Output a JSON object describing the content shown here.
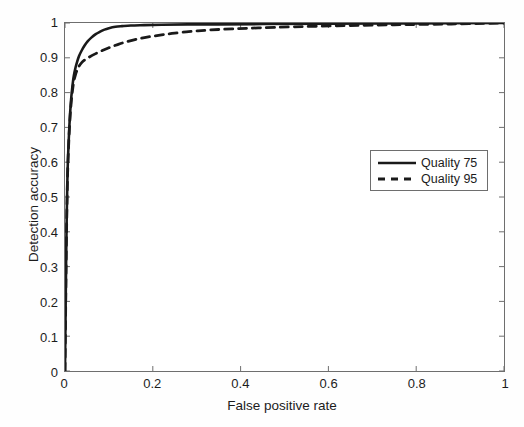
{
  "chart_data": {
    "type": "line",
    "title": "",
    "xlabel": "False positive rate",
    "ylabel": "Detection accuracy",
    "xlim": [
      0,
      1
    ],
    "ylim": [
      0,
      1
    ],
    "grid": false,
    "legend_position": "upper-right",
    "xticks": [
      "0",
      "0.2",
      "0.4",
      "0.6",
      "0.8",
      "1"
    ],
    "xtick_values": [
      0,
      0.2,
      0.4,
      0.6,
      0.8,
      1
    ],
    "yticks": [
      "0",
      "0.1",
      "0.2",
      "0.3",
      "0.4",
      "0.5",
      "0.6",
      "0.7",
      "0.8",
      "0.9",
      "1"
    ],
    "ytick_values": [
      0,
      0.1,
      0.2,
      0.3,
      0.4,
      0.5,
      0.6,
      0.7,
      0.8,
      0.9,
      1
    ],
    "series": [
      {
        "name": "Quality 75",
        "style": "solid",
        "color": "#1a1a1a",
        "points": [
          [
            0.0,
            0.0
          ],
          [
            0.001,
            0.12
          ],
          [
            0.002,
            0.25
          ],
          [
            0.003,
            0.36
          ],
          [
            0.004,
            0.45
          ],
          [
            0.005,
            0.52
          ],
          [
            0.006,
            0.58
          ],
          [
            0.008,
            0.65
          ],
          [
            0.01,
            0.705
          ],
          [
            0.012,
            0.748
          ],
          [
            0.014,
            0.782
          ],
          [
            0.016,
            0.808
          ],
          [
            0.018,
            0.83
          ],
          [
            0.02,
            0.848
          ],
          [
            0.024,
            0.872
          ],
          [
            0.028,
            0.89
          ],
          [
            0.032,
            0.905
          ],
          [
            0.038,
            0.921
          ],
          [
            0.045,
            0.936
          ],
          [
            0.052,
            0.948
          ],
          [
            0.06,
            0.958
          ],
          [
            0.07,
            0.968
          ],
          [
            0.08,
            0.975
          ],
          [
            0.09,
            0.981
          ],
          [
            0.1,
            0.985
          ],
          [
            0.115,
            0.989
          ],
          [
            0.13,
            0.991
          ],
          [
            0.15,
            0.993
          ],
          [
            0.18,
            0.994
          ],
          [
            0.22,
            0.995
          ],
          [
            0.28,
            0.996
          ],
          [
            0.35,
            0.996
          ],
          [
            0.45,
            0.997
          ],
          [
            0.6,
            0.998
          ],
          [
            0.8,
            0.999
          ],
          [
            1.0,
            1.0
          ]
        ]
      },
      {
        "name": "Quality 95",
        "style": "dashed",
        "color": "#1a1a1a",
        "points": [
          [
            0.0,
            0.0
          ],
          [
            0.001,
            0.115
          ],
          [
            0.002,
            0.24
          ],
          [
            0.003,
            0.35
          ],
          [
            0.004,
            0.44
          ],
          [
            0.005,
            0.51
          ],
          [
            0.006,
            0.57
          ],
          [
            0.008,
            0.64
          ],
          [
            0.01,
            0.695
          ],
          [
            0.012,
            0.738
          ],
          [
            0.014,
            0.77
          ],
          [
            0.016,
            0.795
          ],
          [
            0.018,
            0.815
          ],
          [
            0.02,
            0.832
          ],
          [
            0.024,
            0.852
          ],
          [
            0.028,
            0.866
          ],
          [
            0.032,
            0.876
          ],
          [
            0.038,
            0.886
          ],
          [
            0.045,
            0.894
          ],
          [
            0.055,
            0.902
          ],
          [
            0.07,
            0.912
          ],
          [
            0.085,
            0.921
          ],
          [
            0.1,
            0.929
          ],
          [
            0.12,
            0.938
          ],
          [
            0.14,
            0.946
          ],
          [
            0.165,
            0.954
          ],
          [
            0.19,
            0.96
          ],
          [
            0.22,
            0.966
          ],
          [
            0.25,
            0.971
          ],
          [
            0.29,
            0.976
          ],
          [
            0.33,
            0.98
          ],
          [
            0.38,
            0.983
          ],
          [
            0.44,
            0.986
          ],
          [
            0.52,
            0.989
          ],
          [
            0.62,
            0.992
          ],
          [
            0.75,
            0.995
          ],
          [
            0.88,
            0.997
          ],
          [
            1.0,
            1.0
          ]
        ]
      }
    ]
  },
  "legend": {
    "items": [
      {
        "label": "Quality 75",
        "style": "solid"
      },
      {
        "label": "Quality 95",
        "style": "dashed"
      }
    ]
  }
}
